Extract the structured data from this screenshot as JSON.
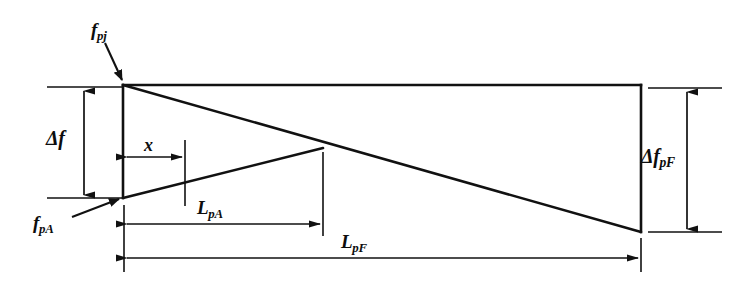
{
  "figure": {
    "type": "engineering-diagram",
    "background_color": "#ffffff",
    "line_color": "#111111"
  },
  "labels": {
    "fpj": {
      "base": "f",
      "sub": "pj"
    },
    "fpA": {
      "base": "f",
      "sub": "pA"
    },
    "delta_f": {
      "base": "Δf",
      "sub": ""
    },
    "delta_f_pF": {
      "base": "Δf",
      "sub": "pF"
    },
    "x": {
      "base": "x",
      "sub": ""
    },
    "LpA": {
      "base": "L",
      "sub": "pA"
    },
    "LpF": {
      "base": "L",
      "sub": "pF"
    }
  },
  "geometry": {
    "frame": {
      "top_left": [
        123,
        85
      ],
      "top_right": [
        641,
        85
      ],
      "bottom_right": [
        641,
        232
      ],
      "bottom_left": [
        123,
        198
      ]
    },
    "diagonal_upper": [
      [
        123,
        85
      ],
      [
        641,
        232
      ]
    ],
    "diagonal_lower": [
      [
        123,
        198
      ],
      [
        323,
        148
      ]
    ],
    "crossing_point": [
      323,
      148
    ]
  },
  "dimensions": [
    {
      "name": "delta-f",
      "orientation": "vertical",
      "x": 84,
      "from": 88,
      "to": 198
    },
    {
      "name": "x",
      "orientation": "horizontal",
      "y": 157,
      "from": 124,
      "to": 185
    },
    {
      "name": "L-pA",
      "orientation": "horizontal",
      "y": 224,
      "from": 124,
      "to": 323
    },
    {
      "name": "L-pF",
      "orientation": "horizontal",
      "y": 258,
      "from": 124,
      "to": 641
    },
    {
      "name": "delta-f-pF",
      "orientation": "vertical",
      "x": 687,
      "from": 89,
      "to": 232
    }
  ],
  "leaders": [
    {
      "name": "fpj-leader",
      "from": [
        106,
        44
      ],
      "to": [
        124,
        83
      ]
    },
    {
      "name": "fpA-leader",
      "from": [
        74,
        216
      ],
      "to": [
        122,
        197
      ]
    }
  ]
}
